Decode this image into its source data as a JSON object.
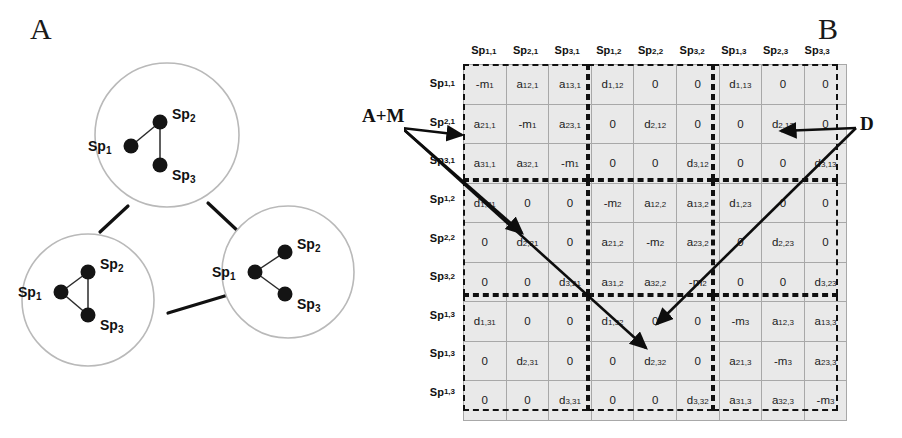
{
  "figure": {
    "panels": [
      {
        "id": "A",
        "letter": "A"
      },
      {
        "id": "B",
        "letter": "B"
      }
    ]
  },
  "panel_a": {
    "letter": "A",
    "description": "Metacommunity of three local communities connected by dispersal",
    "communities": [
      {
        "id": "community-1",
        "position": "top",
        "species": [
          {
            "label": "Sp",
            "sub": "1"
          },
          {
            "label": "Sp",
            "sub": "2"
          },
          {
            "label": "Sp",
            "sub": "3"
          }
        ],
        "interactions": [
          "Sp1-Sp2",
          "Sp2-Sp3"
        ]
      },
      {
        "id": "community-2",
        "position": "bottom-left",
        "species": [
          {
            "label": "Sp",
            "sub": "1"
          },
          {
            "label": "Sp",
            "sub": "2"
          },
          {
            "label": "Sp",
            "sub": "3"
          }
        ],
        "interactions": [
          "Sp1-Sp2",
          "Sp2-Sp3",
          "Sp1-Sp3"
        ]
      },
      {
        "id": "community-3",
        "position": "right",
        "species": [
          {
            "label": "Sp",
            "sub": "1"
          },
          {
            "label": "Sp",
            "sub": "2"
          },
          {
            "label": "Sp",
            "sub": "3"
          }
        ],
        "interactions": [
          "Sp1-Sp2",
          "Sp1-Sp3"
        ]
      }
    ],
    "dispersal_links": [
      "community-1 - community-2",
      "community-1 - community-3",
      "community-2 - community-3"
    ]
  },
  "panel_b": {
    "letter": "B",
    "annotations": {
      "interaction_block_label": "A+M",
      "dispersal_block_label": "D"
    },
    "column_headers": [
      {
        "base": "Sp",
        "sub": "1,1"
      },
      {
        "base": "Sp",
        "sub": "2,1"
      },
      {
        "base": "Sp",
        "sub": "3,1"
      },
      {
        "base": "Sp",
        "sub": "1,2"
      },
      {
        "base": "Sp",
        "sub": "2,2"
      },
      {
        "base": "Sp",
        "sub": "3,2"
      },
      {
        "base": "Sp",
        "sub": "1,3"
      },
      {
        "base": "Sp",
        "sub": "2,3"
      },
      {
        "base": "Sp",
        "sub": "3,3"
      }
    ],
    "row_headers": [
      {
        "base": "Sp",
        "sub": "1,1"
      },
      {
        "base": "Sp",
        "sub": "2,1"
      },
      {
        "base": "Sp",
        "sub": "3,1"
      },
      {
        "base": "Sp",
        "sub": "1,2"
      },
      {
        "base": "Sp",
        "sub": "2,2"
      },
      {
        "base": "Sp",
        "sub": "3,2"
      },
      {
        "base": "Sp",
        "sub": "1,3"
      },
      {
        "base": "Sp",
        "sub": "1,3"
      },
      {
        "base": "Sp",
        "sub": "1,3"
      }
    ],
    "matrix": [
      [
        {
          "base": "-m",
          "sub": "1"
        },
        {
          "base": "a",
          "sub": "12,1"
        },
        {
          "base": "a",
          "sub": "13,1"
        },
        {
          "base": "d",
          "sub": "1,12"
        },
        {
          "base": "0",
          "sub": ""
        },
        {
          "base": "0",
          "sub": ""
        },
        {
          "base": "d",
          "sub": "1,13"
        },
        {
          "base": "0",
          "sub": ""
        },
        {
          "base": "0",
          "sub": ""
        }
      ],
      [
        {
          "base": "a",
          "sub": "21,1"
        },
        {
          "base": "-m",
          "sub": "1"
        },
        {
          "base": "a",
          "sub": "23,1"
        },
        {
          "base": "0",
          "sub": ""
        },
        {
          "base": "d",
          "sub": "2,12"
        },
        {
          "base": "0",
          "sub": ""
        },
        {
          "base": "0",
          "sub": ""
        },
        {
          "base": "d",
          "sub": "2,13"
        },
        {
          "base": "0",
          "sub": ""
        }
      ],
      [
        {
          "base": "a",
          "sub": "31,1"
        },
        {
          "base": "a",
          "sub": "32,1"
        },
        {
          "base": "-m",
          "sub": "1"
        },
        {
          "base": "0",
          "sub": ""
        },
        {
          "base": "0",
          "sub": ""
        },
        {
          "base": "d",
          "sub": "3,12"
        },
        {
          "base": "0",
          "sub": ""
        },
        {
          "base": "0",
          "sub": ""
        },
        {
          "base": "d",
          "sub": "3,13"
        }
      ],
      [
        {
          "base": "d",
          "sub": "1,21"
        },
        {
          "base": "0",
          "sub": ""
        },
        {
          "base": "0",
          "sub": ""
        },
        {
          "base": "-m",
          "sub": "2"
        },
        {
          "base": "a",
          "sub": "12,2"
        },
        {
          "base": "a",
          "sub": "13,2"
        },
        {
          "base": "d",
          "sub": "1,23"
        },
        {
          "base": "0",
          "sub": ""
        },
        {
          "base": "0",
          "sub": ""
        }
      ],
      [
        {
          "base": "0",
          "sub": ""
        },
        {
          "base": "d",
          "sub": "2,21"
        },
        {
          "base": "0",
          "sub": ""
        },
        {
          "base": "a",
          "sub": "21,2"
        },
        {
          "base": "-m",
          "sub": "2"
        },
        {
          "base": "a",
          "sub": "23,2"
        },
        {
          "base": "0",
          "sub": ""
        },
        {
          "base": "d",
          "sub": "2,23"
        },
        {
          "base": "0",
          "sub": ""
        }
      ],
      [
        {
          "base": "0",
          "sub": ""
        },
        {
          "base": "0",
          "sub": ""
        },
        {
          "base": "d",
          "sub": "3,21"
        },
        {
          "base": "a",
          "sub": "31,2"
        },
        {
          "base": "a",
          "sub": "32,2"
        },
        {
          "base": "-m",
          "sub": "2"
        },
        {
          "base": "0",
          "sub": ""
        },
        {
          "base": "0",
          "sub": ""
        },
        {
          "base": "d",
          "sub": "3,23"
        }
      ],
      [
        {
          "base": "d",
          "sub": "1,31"
        },
        {
          "base": "0",
          "sub": ""
        },
        {
          "base": "0",
          "sub": ""
        },
        {
          "base": "d",
          "sub": "1,32"
        },
        {
          "base": "0",
          "sub": ""
        },
        {
          "base": "0",
          "sub": ""
        },
        {
          "base": "-m",
          "sub": "3"
        },
        {
          "base": "a",
          "sub": "12,3"
        },
        {
          "base": "a",
          "sub": "13,3"
        }
      ],
      [
        {
          "base": "0",
          "sub": ""
        },
        {
          "base": "d",
          "sub": "2,31"
        },
        {
          "base": "0",
          "sub": ""
        },
        {
          "base": "0",
          "sub": ""
        },
        {
          "base": "d",
          "sub": "2,32"
        },
        {
          "base": "0",
          "sub": ""
        },
        {
          "base": "a",
          "sub": "21,3"
        },
        {
          "base": "-m",
          "sub": "3"
        },
        {
          "base": "a",
          "sub": "23,3"
        }
      ],
      [
        {
          "base": "0",
          "sub": ""
        },
        {
          "base": "0",
          "sub": ""
        },
        {
          "base": "d",
          "sub": "3,31"
        },
        {
          "base": "0",
          "sub": ""
        },
        {
          "base": "0",
          "sub": ""
        },
        {
          "base": "d",
          "sub": "3,32"
        },
        {
          "base": "a",
          "sub": "31,3"
        },
        {
          "base": "a",
          "sub": "32,3"
        },
        {
          "base": "-m",
          "sub": "3"
        }
      ]
    ],
    "colors": {
      "cell_fill": "#e9e9e9",
      "cell_border": "#a8a8a8",
      "block_border": "#111111",
      "text": "#1b1b1b"
    }
  }
}
